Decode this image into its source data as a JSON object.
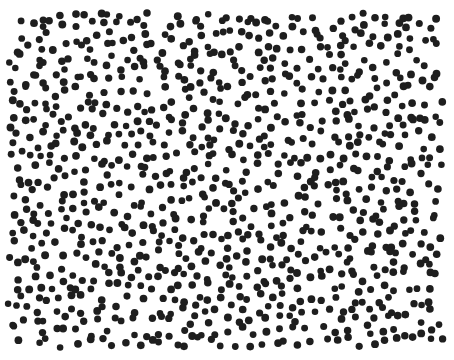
{
  "image": {
    "description": "Random field of black dots on white background",
    "background": "#ffffff",
    "dot_color": "#1e1e1e",
    "dot_radius": 3.6,
    "region": {
      "x0": 10,
      "y0": 15,
      "x1": 444,
      "y1": 350
    },
    "spacing": 12.6,
    "jitter": 0.42,
    "seed": 7
  }
}
